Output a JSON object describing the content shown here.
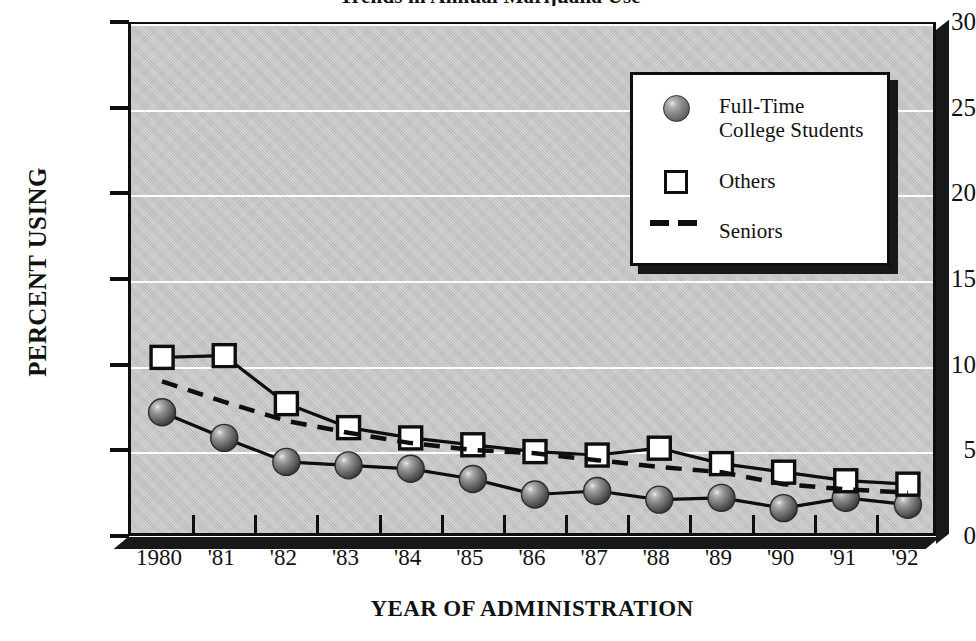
{
  "figure": {
    "clipped_title": "Trends in Annual Marijuana Use",
    "y_axis_title": "PERCENT USING",
    "x_axis_title": "YEAR OF ADMINISTRATION"
  },
  "legend": {
    "items": [
      {
        "label": "Full-Time\nCollege Students",
        "marker": "sphere-marker"
      },
      {
        "label": "Others",
        "marker": "square-marker"
      },
      {
        "label": "Seniors",
        "marker": "dashed-line-marker"
      }
    ]
  },
  "chart_data": {
    "type": "line",
    "title": "Trends in Annual Marijuana Use",
    "xlabel": "YEAR OF ADMINISTRATION",
    "ylabel": "PERCENT USING",
    "ylim": [
      0,
      30
    ],
    "yticks": [
      0,
      5,
      10,
      15,
      20,
      25,
      30
    ],
    "ytick_labels": [
      "0",
      "5",
      "10",
      "15",
      "20",
      "25",
      "30"
    ],
    "grid": true,
    "legend_position": "upper-right",
    "categories": [
      "1980",
      "'81",
      "'82",
      "'83",
      "'84",
      "'85",
      "'86",
      "'87",
      "'88",
      "'89",
      "'90",
      "'91",
      "'92"
    ],
    "series": [
      {
        "name": "Full-Time College Students",
        "marker": "sphere",
        "linestyle": "solid",
        "values": [
          7.4,
          5.9,
          4.5,
          4.3,
          4.1,
          3.5,
          2.6,
          2.8,
          2.3,
          2.4,
          1.8,
          2.4,
          2.0
        ]
      },
      {
        "name": "Others",
        "marker": "square",
        "linestyle": "solid",
        "values": [
          10.6,
          10.7,
          7.9,
          6.5,
          5.9,
          5.5,
          5.1,
          4.9,
          5.3,
          4.4,
          3.9,
          3.4,
          3.2
        ]
      },
      {
        "name": "Seniors",
        "marker": "none",
        "linestyle": "dashed",
        "values": [
          9.2,
          8.0,
          6.9,
          6.2,
          5.6,
          5.2,
          5.0,
          4.6,
          4.2,
          3.9,
          3.2,
          2.9,
          2.7
        ]
      }
    ]
  },
  "colors": {
    "plot_background": "#c9c9c9",
    "frame": "#0e0e0e",
    "gridline": "#fdfdfd",
    "marker_fill": "#ffffff",
    "page_background": "#ffffff"
  }
}
